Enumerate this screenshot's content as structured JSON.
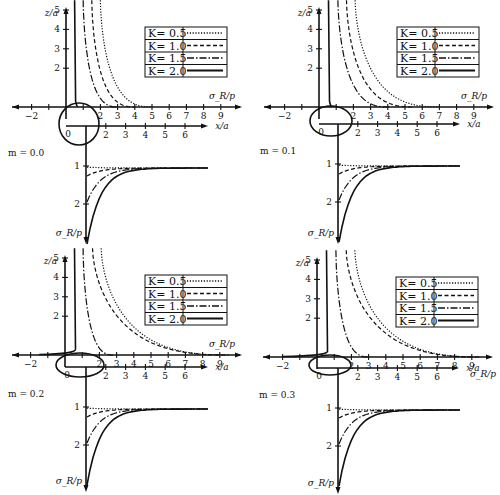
{
  "figure": {
    "panels": [
      {
        "m_label": "m = 0.0",
        "m": 0.0
      },
      {
        "m_label": "m = 0.1",
        "m": 0.1
      },
      {
        "m_label": "m = 0.2",
        "m": 0.2
      },
      {
        "m_label": "m = 0.3",
        "m": 0.3
      }
    ],
    "axis_labels": {
      "z": "z/a",
      "sigma": "σ_R/p",
      "x": "x/a"
    }
  },
  "chart_data": [
    {
      "type": "line",
      "title": "m = 0.0",
      "legend": [
        "K = 0.5",
        "K = 1.0",
        "K = 1.5",
        "K = 2.0"
      ],
      "legend_styles": [
        "dotted",
        "dashed",
        "dash-dot",
        "solid"
      ],
      "legend_position": "upper right",
      "upper_plot": {
        "xlabel": "σ_R/p",
        "ylabel": "z/a",
        "xticks": [
          -2,
          2,
          3,
          4,
          5,
          6,
          7,
          8,
          9
        ],
        "yticks": [
          2,
          3,
          4,
          5
        ],
        "xlim": [
          -3,
          10
        ],
        "ylim": [
          0,
          5.5
        ]
      },
      "x_axis": {
        "label": "x/a",
        "ticks": [
          0,
          2,
          3,
          4,
          5,
          6
        ]
      },
      "lower_plot": {
        "ylabel": "σ_R/p",
        "yticks": [
          1,
          2
        ],
        "asymptote": 1.0
      },
      "series": [
        {
          "name": "K = 0.5",
          "asymptote_sigma": 2.0,
          "decay_to_sigma": 5.0
        },
        {
          "name": "K = 1.0",
          "asymptote_sigma": 1.5,
          "decay_to_sigma": 4.0
        },
        {
          "name": "K = 1.5",
          "asymptote_sigma": 1.0,
          "decay_to_sigma": 3.0
        },
        {
          "name": "K = 2.0",
          "asymptote_sigma": 0.5,
          "decay_to_sigma": 0.6
        }
      ]
    },
    {
      "type": "line",
      "title": "m = 0.1",
      "legend": [
        "K = 0.5",
        "K = 1.0",
        "K = 1.5",
        "K = 2.0"
      ],
      "legend_styles": [
        "dotted",
        "dashed",
        "dash-dot",
        "solid"
      ],
      "upper_plot": {
        "xlabel": "σ_R/p",
        "ylabel": "z/a",
        "xticks": [
          -2,
          2,
          3,
          4,
          5,
          6,
          7,
          8,
          9
        ],
        "yticks": [
          2,
          3,
          4,
          5
        ]
      },
      "x_axis": {
        "label": "x/a",
        "ticks": [
          0,
          2,
          3,
          4,
          5,
          6
        ]
      },
      "lower_plot": {
        "ylabel": "σ_R/p",
        "yticks": [
          1,
          2
        ],
        "asymptote": 1.0
      },
      "series": [
        {
          "name": "K = 0.5",
          "asymptote_sigma": 2.1,
          "decay_to_sigma": 7.0
        },
        {
          "name": "K = 1.0",
          "asymptote_sigma": 1.6,
          "decay_to_sigma": 5.5
        },
        {
          "name": "K = 1.5",
          "asymptote_sigma": 1.1,
          "decay_to_sigma": 4.0
        },
        {
          "name": "K = 2.0",
          "asymptote_sigma": 0.55,
          "decay_to_sigma": 0.7
        }
      ]
    },
    {
      "type": "line",
      "title": "m = 0.2",
      "legend": [
        "K = 0.5",
        "K = 1.0",
        "K = 1.5",
        "K = 2.0"
      ],
      "legend_styles": [
        "dotted",
        "dashed",
        "dash-dot",
        "solid"
      ],
      "upper_plot": {
        "xlabel": "σ_R/p",
        "ylabel": "z/a",
        "xticks": [
          -2,
          2,
          3,
          4,
          5,
          6,
          7,
          8,
          9
        ],
        "yticks": [
          2,
          3,
          4,
          5
        ]
      },
      "x_axis": {
        "label": "x/a",
        "ticks": [
          0,
          2,
          3,
          4,
          5,
          6
        ]
      },
      "lower_plot": {
        "ylabel": "σ_R/p",
        "yticks": [
          1,
          2
        ],
        "asymptote": 1.0
      },
      "series": [
        {
          "name": "K = 0.5",
          "asymptote_sigma": 2.1,
          "decay_to_sigma": 9.5
        },
        {
          "name": "K = 1.0",
          "asymptote_sigma": 1.6,
          "decay_to_sigma": 9.5
        },
        {
          "name": "K = 1.5",
          "asymptote_sigma": 1.05,
          "decay_to_sigma": 2.8
        },
        {
          "name": "K = 2.0",
          "asymptote_sigma": 0.55,
          "decay_to_sigma": -1.5
        }
      ]
    },
    {
      "type": "line",
      "title": "m = 0.3",
      "legend": [
        "K = 0.5",
        "K = 1.0",
        "K = 1.5",
        "K = 2.0"
      ],
      "legend_styles": [
        "dotted",
        "dashed",
        "dash-dot",
        "solid"
      ],
      "upper_plot": {
        "xlabel": "σ_R/p",
        "ylabel": "z/a",
        "xticks": [
          -2,
          2,
          3,
          4,
          5,
          6,
          7,
          8,
          9
        ],
        "yticks": [
          2,
          3,
          4,
          5
        ]
      },
      "x_axis": {
        "label": "x/a",
        "ticks": [
          0,
          2,
          3,
          4,
          5,
          6
        ]
      },
      "lower_plot": {
        "ylabel": "σ_R/p",
        "yticks": [
          1,
          2
        ],
        "asymptote": 1.0
      },
      "series": [
        {
          "name": "K = 0.5",
          "asymptote_sigma": 2.2,
          "decay_to_sigma": 9.5
        },
        {
          "name": "K = 1.0",
          "asymptote_sigma": 1.7,
          "decay_to_sigma": 9.5
        },
        {
          "name": "K = 1.5",
          "asymptote_sigma": 1.1,
          "decay_to_sigma": 3.0
        },
        {
          "name": "K = 2.0",
          "asymptote_sigma": 0.55,
          "decay_to_sigma": -2.0
        }
      ]
    }
  ]
}
